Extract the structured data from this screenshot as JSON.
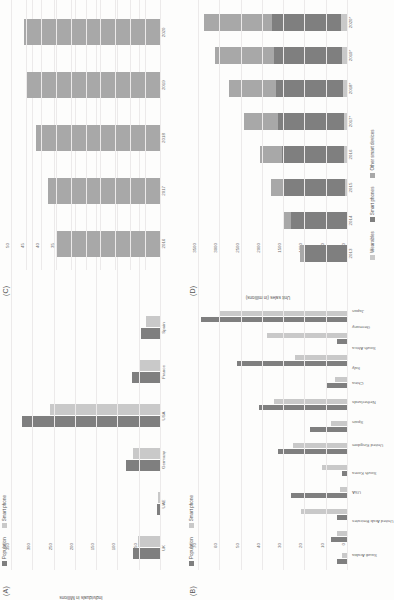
{
  "figure": {
    "orientation": "rotated-90-ccw",
    "panels": [
      "A",
      "B",
      "C",
      "D"
    ]
  },
  "colors": {
    "series_dark": "#7f7f7f",
    "series_light": "#c9c9c9",
    "series_mid": "#a8a8a8",
    "gridline": "#ececec",
    "axis": "#d8d6d6",
    "text": "#5a5a5a"
  },
  "panelA": {
    "tag": "(A)",
    "ylabel": "Individuals in Millions",
    "legend": [
      "Population",
      "Smart phone"
    ],
    "categories": [
      "UK",
      "UAE",
      "Germany",
      "USA",
      "France",
      "Spain"
    ],
    "yticks": [
      "350",
      "300",
      "250",
      "200",
      "150",
      "100",
      "50",
      "0"
    ]
  },
  "panelB": {
    "tag": "(B)",
    "legend": [
      "Population",
      "Smart phone"
    ],
    "categories": [
      "Saudi Arabia",
      "United Arab Emirates",
      "USA",
      "South Korea",
      "United Kingdom",
      "Spain",
      "Netherlands",
      "China",
      "Italy",
      "South Africa",
      "Germany",
      "Japan"
    ],
    "yticks": [
      "70",
      "60",
      "50",
      "40",
      "30",
      "20",
      "10",
      "0"
    ]
  },
  "panelC": {
    "tag": "(C)",
    "categories": [
      "2016",
      "2017",
      "2018",
      "2019",
      "2020"
    ],
    "yticks": [
      "50",
      "45",
      "40",
      "35",
      "30",
      "25",
      "20",
      "15",
      "10",
      "5",
      "0"
    ]
  },
  "panelD": {
    "tag": "(D)",
    "ylabel": "Unit sales (in millions)",
    "legend": [
      "Wearables",
      "Smart phones",
      "Other smart devices"
    ],
    "categories": [
      "2013",
      "2014",
      "2015",
      "2016",
      "2017*",
      "2018*",
      "2019*",
      "2020*"
    ],
    "yticks": [
      "3500",
      "3000",
      "2500",
      "2000",
      "1500",
      "1000",
      "500",
      "0"
    ]
  },
  "chart_data": [
    {
      "id": "A",
      "type": "bar",
      "title": "(A)",
      "xlabel": "",
      "ylabel": "Individuals in Millions",
      "ylim": [
        0,
        350
      ],
      "yticks": [
        0,
        50,
        100,
        150,
        200,
        250,
        300,
        350
      ],
      "grid": true,
      "legend": [
        "Population",
        "Smart phone"
      ],
      "legend_position": "top-left",
      "categories": [
        "UK",
        "UAE",
        "Germany",
        "USA",
        "France",
        "Spain"
      ],
      "series": [
        {
          "name": "Population",
          "values": [
            66,
            9.6,
            83,
            327,
            67,
            47
          ]
        },
        {
          "name": "Smart phone",
          "values": [
            53,
            7.8,
            65,
            260,
            49,
            36
          ]
        }
      ]
    },
    {
      "id": "B",
      "type": "bar",
      "title": "(B)",
      "xlabel": "",
      "ylabel": "",
      "ylim": [
        0,
        70
      ],
      "yticks": [
        0,
        10,
        20,
        30,
        40,
        50,
        60,
        70
      ],
      "grid": true,
      "legend": [
        "Population",
        "Smart phone"
      ],
      "legend_position": "top-left",
      "categories": [
        "Saudi Arabia",
        "United Arab Emirates",
        "USA",
        "South Korea",
        "United Kingdom",
        "Spain",
        "Netherlands",
        "China",
        "Italy",
        "South Africa",
        "Germany",
        "Japan"
      ],
      "series": [
        {
          "name": "Population",
          "values": [
            5,
            8,
            5,
            27,
            3,
            33,
            18,
            42,
            10,
            52,
            5,
            69
          ]
        },
        {
          "name": "Smart phone",
          "values": [
            3,
            5,
            22,
            4,
            12,
            26,
            8,
            35,
            6,
            25,
            38,
            60
          ]
        }
      ]
    },
    {
      "id": "C",
      "type": "bar",
      "title": "(C)",
      "xlabel": "",
      "ylabel": "",
      "ylim": [
        0,
        50
      ],
      "yticks": [
        0,
        5,
        10,
        15,
        20,
        25,
        30,
        35,
        40,
        45,
        50
      ],
      "grid": true,
      "categories": [
        "2016",
        "2017",
        "2018",
        "2019",
        "2020"
      ],
      "values": [
        35,
        38,
        42,
        45,
        46
      ]
    },
    {
      "id": "D",
      "type": "bar",
      "subtype": "stacked",
      "title": "(D)",
      "xlabel": "",
      "ylabel": "Unit sales (in millions)",
      "ylim": [
        0,
        3500
      ],
      "yticks": [
        0,
        500,
        1000,
        1500,
        2000,
        2500,
        3000,
        3500
      ],
      "grid": true,
      "legend": [
        "Wearables",
        "Smart phones",
        "Other smart devices"
      ],
      "legend_position": "bottom",
      "categories": [
        "2013",
        "2014",
        "2015",
        "2016",
        "2017*",
        "2018*",
        "2019*",
        "2020*"
      ],
      "series": [
        {
          "name": "Wearables",
          "values": [
            20,
            35,
            60,
            85,
            105,
            125,
            145,
            165
          ]
        },
        {
          "name": "Smart phones",
          "values": [
            1000,
            1300,
            1440,
            1470,
            1540,
            1570,
            1600,
            1620
          ]
        },
        {
          "name": "Other smart devices",
          "values": [
            120,
            180,
            300,
            520,
            800,
            1100,
            1380,
            1600
          ]
        }
      ]
    }
  ]
}
